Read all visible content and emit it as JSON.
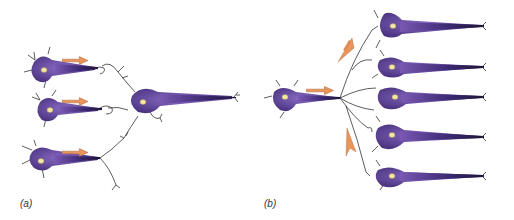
{
  "panels": [
    {
      "id": "a",
      "label": "(a)",
      "description": "convergence: three presynaptic neurons synapse onto one postsynaptic neuron"
    },
    {
      "id": "b",
      "label": "(b)",
      "description": "divergence: one presynaptic neuron branches to five postsynaptic neurons"
    }
  ],
  "colors": {
    "neuron_body": "#6a4aa0",
    "neuron_dark": "#2e1f55",
    "nucleus": "#f5e6a8",
    "arrow": "#e8945a",
    "branch": "#333333",
    "background": "#ffffff"
  }
}
